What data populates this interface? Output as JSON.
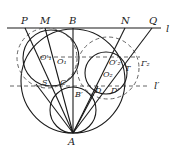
{
  "diagram": {
    "labels": {
      "P": "P",
      "M": "M",
      "B": "B",
      "N": "N",
      "Q": "Q",
      "l": "l",
      "l_prime": "l′",
      "Gamma2": "Γ₂",
      "T": "T",
      "O1p": "O′₁",
      "O1": "O₁",
      "O2p": "O′₂",
      "O2": "O₂",
      "S": "S",
      "C": "C",
      "Bp": "B′",
      "D": "D",
      "Dp": "D′",
      "A": "A"
    },
    "colors": {
      "stroke": "#1a1a1a",
      "dashed": "#555555",
      "background": "#ffffff"
    }
  }
}
